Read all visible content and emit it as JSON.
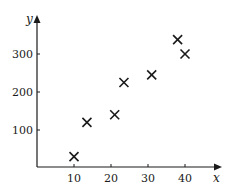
{
  "chart_data": {
    "type": "scatter",
    "title": "",
    "xlabel": "x",
    "ylabel": "y",
    "x_ticks": [
      10,
      20,
      30,
      40
    ],
    "y_ticks": [
      100,
      200,
      300
    ],
    "x_tick_labels": [
      "10",
      "20",
      "30",
      "40"
    ],
    "y_tick_labels": [
      "100",
      "200",
      "300"
    ],
    "xlim": [
      0,
      49
    ],
    "ylim": [
      0,
      395
    ],
    "grid": false,
    "legend": null,
    "marker": "x",
    "series": [
      {
        "name": "data",
        "points": [
          {
            "x": 10,
            "y": 30
          },
          {
            "x": 13.5,
            "y": 120
          },
          {
            "x": 21,
            "y": 140
          },
          {
            "x": 23.5,
            "y": 225
          },
          {
            "x": 31,
            "y": 245
          },
          {
            "x": 38,
            "y": 338
          },
          {
            "x": 40,
            "y": 300
          }
        ]
      }
    ],
    "colors": {
      "axis": "#1a1a1a",
      "marker": "#1a1a1a"
    }
  }
}
